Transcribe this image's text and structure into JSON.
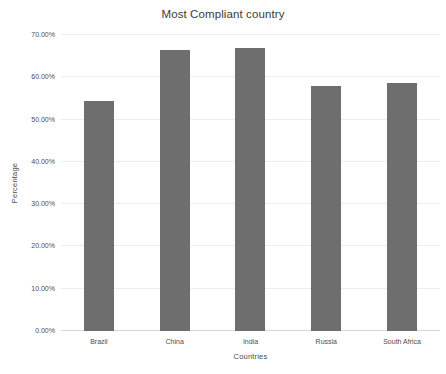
{
  "chart_data": {
    "type": "bar",
    "title": "Most Compliant country",
    "xlabel": "Countries",
    "ylabel": "Percentage",
    "categories": [
      "Brazil",
      "China",
      "India",
      "Russia",
      "South Africa"
    ],
    "values": [
      54.5,
      66.5,
      67.0,
      58.0,
      58.7
    ],
    "value_format": "percent",
    "ylim": [
      0,
      70
    ],
    "ytick_values": [
      0,
      10,
      20,
      30,
      40,
      50,
      60,
      70
    ],
    "ytick_labels": [
      "0.00%",
      "10.00%",
      "20.00%",
      "30.00%",
      "40.00%",
      "50.00%",
      "60.00%",
      "70.00%"
    ],
    "grid": true,
    "grid_axis": "y",
    "legend": false,
    "bar_color": "#6e6e6e",
    "gridline_color": "#ececed",
    "background_color": "#ffffff",
    "text_color": "#4d4d4d"
  }
}
